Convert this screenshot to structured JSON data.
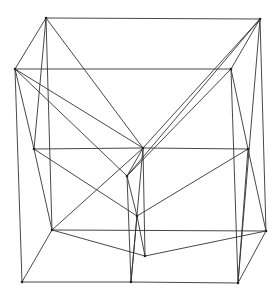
{
  "diagram": {
    "type": "wireframe-polyhedron",
    "stroke_color": "#333333",
    "background": "#ffffff",
    "vertices": {
      "A": [
        46,
        18
      ],
      "B": [
        260,
        19
      ],
      "C": [
        15,
        69
      ],
      "D": [
        231,
        69
      ],
      "E": [
        34,
        149
      ],
      "F": [
        143,
        148
      ],
      "G": [
        248,
        149
      ],
      "H": [
        127,
        176
      ],
      "I": [
        137,
        216
      ],
      "J": [
        52,
        230
      ],
      "K": [
        266,
        231
      ],
      "L": [
        145,
        256
      ],
      "M": [
        22,
        282
      ],
      "N": [
        131,
        282
      ],
      "O": [
        238,
        283
      ]
    },
    "edges": [
      [
        "A",
        "B"
      ],
      [
        "A",
        "C"
      ],
      [
        "A",
        "E"
      ],
      [
        "A",
        "J"
      ],
      [
        "A",
        "F"
      ],
      [
        "B",
        "D"
      ],
      [
        "B",
        "F"
      ],
      [
        "B",
        "H"
      ],
      [
        "B",
        "K"
      ],
      [
        "B",
        "O"
      ],
      [
        "C",
        "D"
      ],
      [
        "C",
        "E"
      ],
      [
        "C",
        "M"
      ],
      [
        "C",
        "F"
      ],
      [
        "C",
        "H"
      ],
      [
        "D",
        "G"
      ],
      [
        "D",
        "H"
      ],
      [
        "D",
        "O"
      ],
      [
        "E",
        "F"
      ],
      [
        "E",
        "J"
      ],
      [
        "E",
        "I"
      ],
      [
        "F",
        "G"
      ],
      [
        "F",
        "H"
      ],
      [
        "F",
        "L"
      ],
      [
        "F",
        "N"
      ],
      [
        "F",
        "J"
      ],
      [
        "G",
        "K"
      ],
      [
        "G",
        "I"
      ],
      [
        "G",
        "O"
      ],
      [
        "H",
        "I"
      ],
      [
        "H",
        "N"
      ],
      [
        "I",
        "L"
      ],
      [
        "I",
        "N"
      ],
      [
        "J",
        "K"
      ],
      [
        "J",
        "M"
      ],
      [
        "J",
        "L"
      ],
      [
        "K",
        "L"
      ],
      [
        "K",
        "O"
      ],
      [
        "M",
        "N"
      ],
      [
        "N",
        "O"
      ]
    ]
  }
}
